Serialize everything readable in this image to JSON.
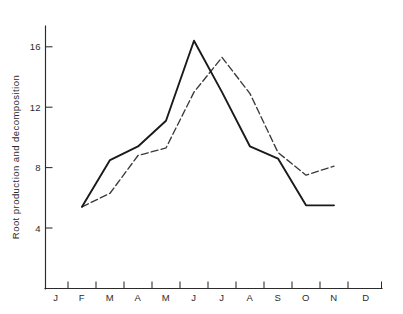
{
  "chart_data": {
    "type": "line",
    "title": "",
    "xlabel": "",
    "ylabel": "Root production and decomposition",
    "categories": [
      "J",
      "F",
      "M",
      "A",
      "M",
      "J",
      "J",
      "A",
      "S",
      "O",
      "N",
      "D"
    ],
    "x_tick_labels": [
      "J",
      "F",
      "M",
      "A",
      "M",
      "J",
      "J",
      "A",
      "S",
      "O",
      "N",
      "D"
    ],
    "y_tick_labels": [
      "4",
      "8",
      "12",
      "16"
    ],
    "y_ticks": [
      4,
      8,
      12,
      16
    ],
    "ylim": [
      0,
      17.6
    ],
    "xlim": [
      0,
      13
    ],
    "grid": false,
    "legend": "none",
    "series": [
      {
        "name": "root-production-solid",
        "style": "solid",
        "color": "#1a1a1a",
        "x": [
          "F",
          "M",
          "A",
          "M",
          "J",
          "J",
          "A",
          "S",
          "O",
          "N"
        ],
        "values": [
          5.4,
          8.5,
          9.4,
          11.1,
          16.4,
          13.0,
          9.4,
          8.6,
          5.5,
          5.5
        ]
      },
      {
        "name": "root-decomposition-dashed",
        "style": "dashed",
        "color": "#3a3a3a",
        "x": [
          "F",
          "M",
          "A",
          "M",
          "J",
          "J",
          "A",
          "S",
          "O",
          "N"
        ],
        "values": [
          5.4,
          6.3,
          8.8,
          9.3,
          13.0,
          15.3,
          12.9,
          9.0,
          7.5,
          8.1
        ]
      }
    ]
  },
  "axes": {
    "y_axis_title": "Root production and decomposition",
    "y_labels": [
      "16",
      "12",
      "8",
      "4"
    ],
    "x_labels": [
      "J",
      "F",
      "M",
      "A",
      "M",
      "J",
      "J",
      "A",
      "S",
      "O",
      "N",
      "D"
    ]
  }
}
